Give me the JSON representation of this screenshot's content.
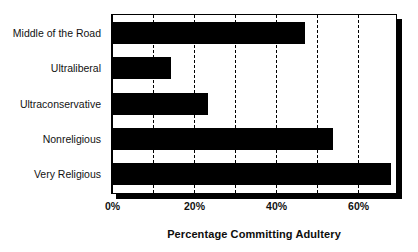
{
  "chart_data": {
    "type": "bar",
    "orientation": "horizontal",
    "title": "",
    "xlabel": "Percentage Committing Adultery",
    "ylabel": "",
    "categories": [
      "Middle of the Road",
      "Ultraliberal",
      "Ultraconservative",
      "Nonreligious",
      "Very Religious"
    ],
    "values": [
      47,
      14.5,
      23.5,
      54,
      68
    ],
    "xlim": [
      0,
      69
    ],
    "xticks": [
      0,
      20,
      40,
      60
    ],
    "xtick_labels": [
      "0%",
      "20%",
      "40%",
      "60%"
    ],
    "gridlines_at": [
      0,
      10,
      20,
      30,
      40,
      50,
      60
    ],
    "grid": true,
    "legend": "none",
    "bar_color": "#000000",
    "background_color": "#ffffff"
  },
  "axis": {
    "x_title": "Percentage Committing Adultery",
    "ticks": [
      {
        "label": "0%",
        "value": 0
      },
      {
        "label": "20%",
        "value": 20
      },
      {
        "label": "40%",
        "value": 40
      },
      {
        "label": "60%",
        "value": 60
      }
    ]
  },
  "bars": [
    {
      "label": "Middle of the Road",
      "value": 47
    },
    {
      "label": "Ultraliberal",
      "value": 14.5
    },
    {
      "label": "Ultraconservative",
      "value": 23.5
    },
    {
      "label": "Nonreligious",
      "value": 54
    },
    {
      "label": "Very Religious",
      "value": 68
    }
  ]
}
